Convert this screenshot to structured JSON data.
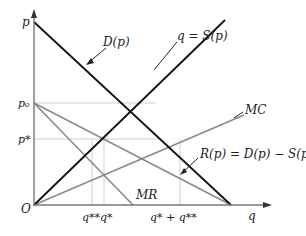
{
  "diagram": {
    "type": "economics-supply-demand",
    "colors": {
      "axis": "#777777",
      "curve_dark": "#111111",
      "curve_gray": "#8a8a8a",
      "guide": "#cfcfcf",
      "text": "#222222"
    },
    "axes": {
      "y_label": "p",
      "x_label": "q",
      "origin_label": "O"
    },
    "y_ticks": {
      "p0": "p₀",
      "pstar": "p*"
    },
    "x_ticks": {
      "q_double_star_q_star": "q**q*",
      "q_star_plus_q_double_star": "q* + q**"
    },
    "curves": {
      "demand": "D(p)",
      "supply": "q = S(p)",
      "marginal_cost": "MC",
      "marginal_revenue": "MR",
      "residual": "R(p) = D(p) − S(p)"
    }
  }
}
